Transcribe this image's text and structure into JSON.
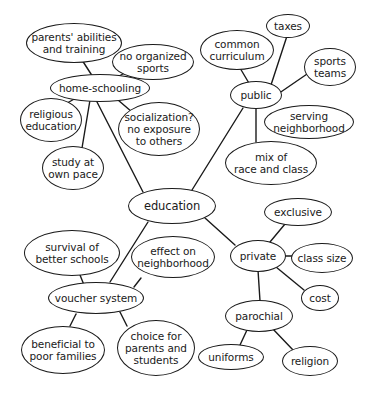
{
  "diagram": {
    "type": "concept-map",
    "center": "education",
    "nodes": {
      "education": "education",
      "home_schooling": "home-schooling",
      "parents_abilities": "parents' abilities\nand training",
      "no_organized_sports": "no organized\nsports",
      "religious_education": "religious\neducation",
      "socialization": "socialization?\nno exposure\nto others",
      "study_own_pace": "study at\nown pace",
      "public": "public",
      "common_curriculum": "common\ncurriculum",
      "taxes": "taxes",
      "sports_teams": "sports\nteams",
      "serving_neighborhood": "serving\nneighborhood",
      "mix_race_class": "mix of\nrace and class",
      "private": "private",
      "exclusive": "exclusive",
      "class_size": "class size",
      "cost": "cost",
      "parochial": "parochial",
      "uniforms": "uniforms",
      "religion": "religion",
      "voucher_system": "voucher system",
      "survival_better_schools": "survival of\nbetter schools",
      "effect_neighborhood": "effect on\nneighborhood",
      "beneficial_poor": "beneficial to\npoor families",
      "choice_parents_students": "choice for\nparents and\nstudents"
    },
    "edges": [
      [
        "education",
        "home-schooling"
      ],
      [
        "education",
        "public"
      ],
      [
        "education",
        "private"
      ],
      [
        "education",
        "voucher system"
      ],
      [
        "home-schooling",
        "parents' abilities and training"
      ],
      [
        "home-schooling",
        "no organized sports"
      ],
      [
        "home-schooling",
        "religious education"
      ],
      [
        "home-schooling",
        "socialization? no exposure to others"
      ],
      [
        "home-schooling",
        "study at own pace"
      ],
      [
        "public",
        "common curriculum"
      ],
      [
        "public",
        "taxes"
      ],
      [
        "public",
        "sports teams"
      ],
      [
        "public",
        "mix of race and class"
      ],
      [
        "private",
        "exclusive"
      ],
      [
        "private",
        "class size"
      ],
      [
        "private",
        "cost"
      ],
      [
        "private",
        "parochial"
      ],
      [
        "parochial",
        "uniforms"
      ],
      [
        "parochial",
        "religion"
      ],
      [
        "voucher system",
        "survival of better schools"
      ],
      [
        "voucher system",
        "effect on neighborhood"
      ],
      [
        "voucher system",
        "beneficial to poor families"
      ],
      [
        "voucher system",
        "choice for parents and students"
      ]
    ]
  }
}
